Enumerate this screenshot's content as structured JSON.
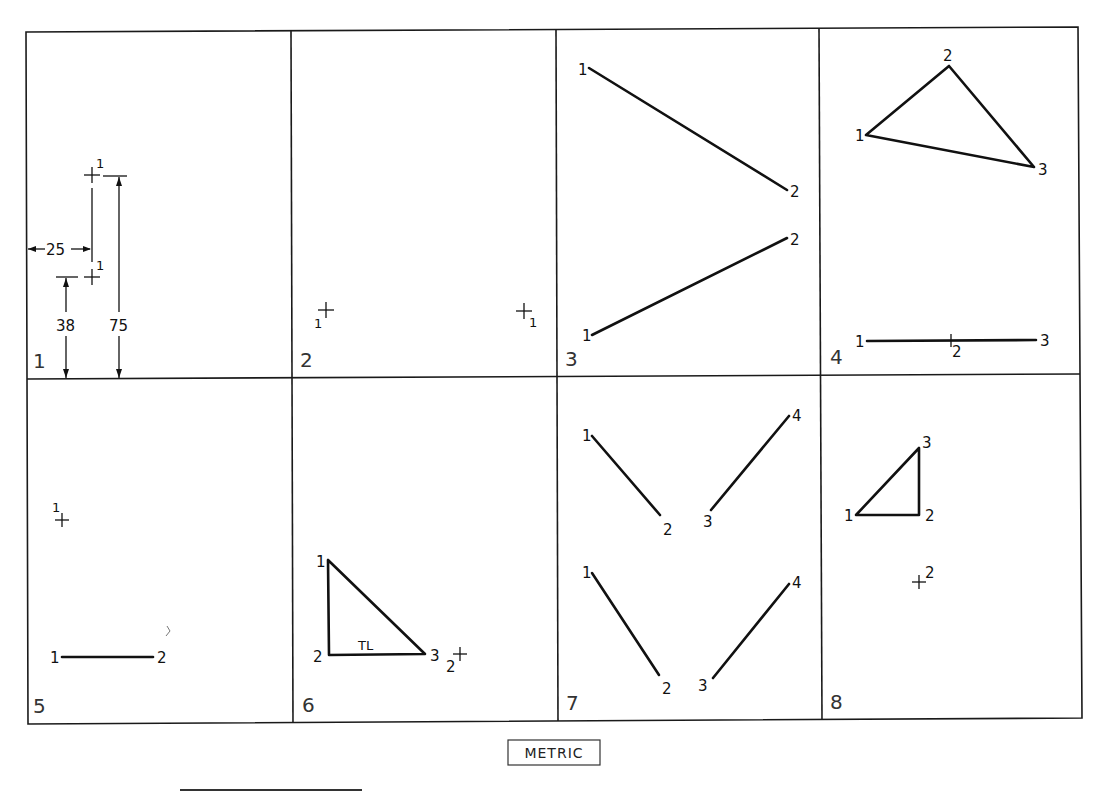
{
  "sheet": {
    "title_badge": "METRIC",
    "frame": {
      "left": 26,
      "top": 29,
      "right": 1080,
      "bottom": 722,
      "mid_y": 377,
      "col_x": [
        292,
        557,
        821
      ]
    },
    "panels": [
      {
        "number": "1"
      },
      {
        "number": "2"
      },
      {
        "number": "3"
      },
      {
        "number": "4"
      },
      {
        "number": "5"
      },
      {
        "number": "6"
      },
      {
        "number": "7"
      },
      {
        "number": "8"
      }
    ]
  },
  "panel1": {
    "dimension_horizontal": "25",
    "dimension_vertical_low": "38",
    "dimension_vertical_high": "75",
    "point_upper_label": "1",
    "point_lower_label": "1"
  },
  "panel2": {
    "point_left_label": "1",
    "point_right_label": "1"
  },
  "panel3": {
    "line_a": {
      "start_label": "1",
      "end_label": "2"
    },
    "line_b": {
      "start_label": "1",
      "end_label": "2"
    }
  },
  "panel4": {
    "triangle": {
      "v1": "1",
      "v2": "2",
      "v3": "3"
    },
    "edge_line": {
      "p1": "1",
      "p2": "2",
      "p3": "3"
    }
  },
  "panel5": {
    "point_label": "1",
    "line": {
      "start_label": "1",
      "end_label": "2"
    }
  },
  "panel6": {
    "triangle": {
      "v1": "1",
      "v2": "2",
      "v3": "3"
    },
    "true_length_label": "TL",
    "point_label": "2"
  },
  "panel7": {
    "upper": {
      "p1": "1",
      "p2": "2",
      "p3": "3",
      "p4": "4"
    },
    "lower": {
      "p1": "1",
      "p2": "2",
      "p3": "3",
      "p4": "4"
    }
  },
  "panel8": {
    "triangle": {
      "v1": "1",
      "v2": "2",
      "v3": "3"
    },
    "point_label": "2"
  }
}
